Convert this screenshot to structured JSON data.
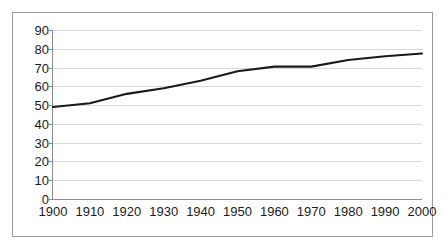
{
  "chart_data": {
    "type": "line",
    "title": "",
    "subtitle": "",
    "xlabel": "",
    "ylabel": "",
    "x": [
      1900,
      1910,
      1920,
      1930,
      1940,
      1950,
      1960,
      1970,
      1980,
      1990,
      2000
    ],
    "categories": [
      "1900",
      "1910",
      "1920",
      "1930",
      "1940",
      "1950",
      "1960",
      "1970",
      "1980",
      "1990",
      "2000"
    ],
    "values": [
      49,
      51,
      56,
      59,
      63,
      68,
      70.5,
      70.5,
      74,
      76,
      77.5
    ],
    "series": [
      {
        "name": "",
        "values": [
          49,
          51,
          56,
          59,
          63,
          68,
          70.5,
          70.5,
          74,
          76,
          77.5
        ]
      }
    ],
    "ylim": [
      0,
      90
    ],
    "xlim": [
      1900,
      2000
    ],
    "yticks": [
      0,
      10,
      20,
      30,
      40,
      50,
      60,
      70,
      80,
      90
    ],
    "ytick_labels": [
      "0",
      "10",
      "20",
      "30",
      "40",
      "50",
      "60",
      "70",
      "80",
      "90"
    ],
    "xticks": [
      1900,
      1910,
      1920,
      1930,
      1940,
      1950,
      1960,
      1970,
      1980,
      1990,
      2000
    ],
    "xtick_labels": [
      "1900",
      "1910",
      "1920",
      "1930",
      "1940",
      "1950",
      "1960",
      "1970",
      "1980",
      "1990",
      "2000"
    ],
    "grid": "horizontal",
    "legend": "none",
    "line_color": "#1a1a1a",
    "grid_color": "#d9d9d9",
    "axis_color": "#8c8c8c",
    "border_color": "#9a9a9a",
    "background_color": "#ffffff",
    "annotations": []
  }
}
